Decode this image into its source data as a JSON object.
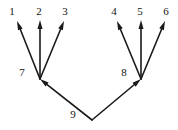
{
  "figure": {
    "kind": "directed-graph-diagram",
    "background_color": "#ffffff",
    "stroke_color": "#1a1a1a",
    "label_color": "#141414",
    "width": 178,
    "height": 130
  },
  "graph_data": {
    "type": "directed-tree",
    "nodes": [
      {
        "id": "1",
        "label": "1",
        "label_x": 12,
        "label_y": 11,
        "point_x": 17,
        "point_y": 21
      },
      {
        "id": "2",
        "label": "2",
        "label_x": 39,
        "label_y": 11,
        "point_x": 40,
        "point_y": 20
      },
      {
        "id": "3",
        "label": "3",
        "label_x": 65,
        "label_y": 11,
        "point_x": 64,
        "point_y": 21
      },
      {
        "id": "4",
        "label": "4",
        "label_x": 114,
        "label_y": 11,
        "point_x": 117,
        "point_y": 21
      },
      {
        "id": "5",
        "label": "5",
        "label_x": 140,
        "label_y": 11,
        "point_x": 141,
        "point_y": 20
      },
      {
        "id": "6",
        "label": "6",
        "label_x": 166,
        "label_y": 11,
        "point_x": 165,
        "point_y": 21
      },
      {
        "id": "7",
        "label": "7",
        "label_x": 22,
        "label_y": 72,
        "point_x": 40,
        "point_y": 79
      },
      {
        "id": "8",
        "label": "8",
        "label_x": 124,
        "label_y": 72,
        "point_x": 141,
        "point_y": 79
      },
      {
        "id": "9",
        "label": "9",
        "label_x": 73,
        "label_y": 114,
        "point_x": 92,
        "point_y": 120
      }
    ],
    "edges": [
      {
        "from": "7",
        "to": "1",
        "x1": 40,
        "y1": 79,
        "x2": 17,
        "y2": 21
      },
      {
        "from": "7",
        "to": "2",
        "x1": 40,
        "y1": 79,
        "x2": 40,
        "y2": 20
      },
      {
        "from": "7",
        "to": "3",
        "x1": 40,
        "y1": 79,
        "x2": 64,
        "y2": 21
      },
      {
        "from": "8",
        "to": "4",
        "x1": 141,
        "y1": 79,
        "x2": 117,
        "y2": 21
      },
      {
        "from": "8",
        "to": "5",
        "x1": 141,
        "y1": 79,
        "x2": 141,
        "y2": 20
      },
      {
        "from": "8",
        "to": "6",
        "x1": 141,
        "y1": 79,
        "x2": 165,
        "y2": 21
      },
      {
        "from": "9",
        "to": "7",
        "x1": 92,
        "y1": 120,
        "x2": 40,
        "y2": 79
      },
      {
        "from": "9",
        "to": "8",
        "x1": 92,
        "y1": 120,
        "x2": 141,
        "y2": 79
      }
    ],
    "edge_count": 8,
    "node_count": 9,
    "roots": [
      "9"
    ],
    "leaves": [
      "1",
      "2",
      "3",
      "4",
      "5",
      "6"
    ],
    "stroke_width": 1.6,
    "arrowhead_length": 9,
    "arrowhead_width": 5
  }
}
